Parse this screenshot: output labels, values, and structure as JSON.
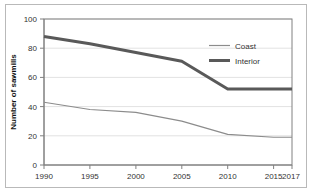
{
  "chart_data": {
    "type": "line",
    "title": "",
    "subtitle": "",
    "xlabel": "",
    "ylabel": "Number of sawmills",
    "x": [
      1990,
      1995,
      2000,
      2005,
      2010,
      2015,
      2017
    ],
    "categories": [
      "1990",
      "1995",
      "2000",
      "2005",
      "2010",
      "2015",
      "2017"
    ],
    "series": [
      {
        "name": "Coast",
        "values": [
          43,
          38,
          36,
          30,
          21,
          19,
          19
        ],
        "color": "#8c8c8c",
        "line_width": 1
      },
      {
        "name": "Interior",
        "values": [
          88,
          83,
          77,
          71,
          52,
          52,
          52
        ],
        "color": "#595959",
        "line_width": 3
      }
    ],
    "xlim": [
      1990,
      2017
    ],
    "ylim": [
      0,
      100
    ],
    "yticks": [
      0,
      20,
      40,
      60,
      80,
      100
    ],
    "ytick_labels": [
      "0",
      "20",
      "40",
      "60",
      "80",
      "100"
    ],
    "xtick_labels": [
      "1990",
      "1995",
      "2000",
      "2005",
      "2010",
      "2015",
      "2017"
    ],
    "grid": "horizontal",
    "grid_color": "#e2e2e2",
    "legend_position": "top-right-inside",
    "plot_border_color": "#808080",
    "background": "#ffffff"
  },
  "legend": {
    "entries": [
      {
        "label": "Coast"
      },
      {
        "label": "Interior"
      }
    ]
  },
  "frame": {
    "border_color": "#b9b9b9"
  }
}
